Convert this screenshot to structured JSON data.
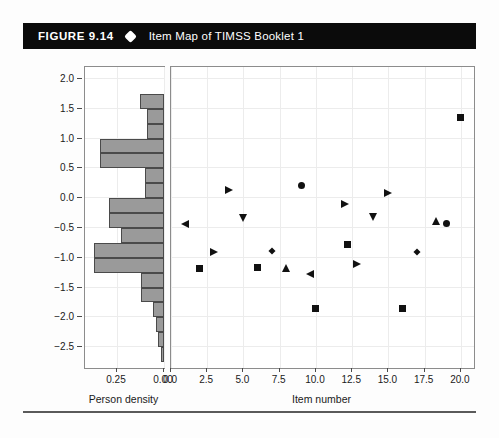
{
  "header": {
    "figure_label": "FIGURE 9.14",
    "bullet_icon": "diamond-bullet-icon",
    "title": "Item Map of TIMSS Booklet 1",
    "background_color": "#0b0b0b",
    "text_color": "#ffffff"
  },
  "chart_data": {
    "type": "scatter",
    "title": "Item Map of TIMSS Booklet 1",
    "ylabel": "Logits",
    "ylim": [
      -2.85,
      2.2
    ],
    "yticks": [
      2.0,
      1.5,
      1.0,
      0.5,
      0.0,
      -0.5,
      -1.0,
      -1.5,
      -2.0,
      -2.5
    ],
    "ytick_labels": [
      "2.0",
      "1.5",
      "1.0",
      "0.5",
      "0.0",
      "−0.5",
      "−1.0",
      "−1.5",
      "−2.0",
      "−2.5"
    ],
    "grid": true,
    "legend": "none",
    "marker_color": "#111111",
    "panels": [
      {
        "name": "person-density",
        "type": "bar",
        "orientation": "horizontal",
        "xlabel": "Person density",
        "xlim": [
          0.42,
          0.0
        ],
        "xticks": [
          0.25,
          0.0
        ],
        "xtick_labels": [
          "0.25",
          "0.00"
        ],
        "bar_fill": "#9a9a9a",
        "bar_edge": "#4a4a4a",
        "bin_edges": [
          2.0,
          1.75,
          1.5,
          1.25,
          1.0,
          0.75,
          0.5,
          0.25,
          0.0,
          -0.25,
          -0.5,
          -0.75,
          -1.0,
          -1.25,
          -1.5,
          -1.75,
          -2.0,
          -2.25,
          -2.5,
          -2.75
        ],
        "bin_centers": [
          1.875,
          1.625,
          1.375,
          1.125,
          0.875,
          0.625,
          0.375,
          0.125,
          -0.125,
          -0.375,
          -0.625,
          -0.875,
          -1.125,
          -1.375,
          -1.625,
          -1.875,
          -2.125,
          -2.375,
          -2.625
        ],
        "densities": [
          0.0,
          0.13,
          0.09,
          0.09,
          0.34,
          0.34,
          0.1,
          0.1,
          0.29,
          0.29,
          0.23,
          0.37,
          0.37,
          0.12,
          0.12,
          0.06,
          0.04,
          0.03,
          0.015
        ]
      },
      {
        "name": "item-map",
        "type": "scatter",
        "xlabel": "Item number",
        "xlim": [
          0.0,
          20.9
        ],
        "xticks": [
          0.0,
          2.5,
          5.0,
          7.5,
          10.0,
          12.5,
          15.0,
          17.5,
          20.0
        ],
        "xtick_labels": [
          "0.0",
          "2.5",
          "5.0",
          "7.5",
          "10.0",
          "12.5",
          "15.0",
          "17.5",
          "20.0"
        ],
        "points": [
          {
            "item": 1.0,
            "logit": -0.45,
            "shape": "triangle-left"
          },
          {
            "item": 2.0,
            "logit": -1.18,
            "shape": "square"
          },
          {
            "item": 3.0,
            "logit": -0.92,
            "shape": "triangle-right"
          },
          {
            "item": 4.0,
            "logit": 0.13,
            "shape": "triangle-right"
          },
          {
            "item": 5.0,
            "logit": -0.33,
            "shape": "triangle-down"
          },
          {
            "item": 6.0,
            "logit": -1.17,
            "shape": "square"
          },
          {
            "item": 7.0,
            "logit": -0.88,
            "shape": "diamond"
          },
          {
            "item": 8.0,
            "logit": -1.17,
            "shape": "triangle-up"
          },
          {
            "item": 9.0,
            "logit": 0.22,
            "shape": "circle"
          },
          {
            "item": 9.6,
            "logit": -1.28,
            "shape": "triangle-left"
          },
          {
            "item": 10.0,
            "logit": -1.85,
            "shape": "square"
          },
          {
            "item": 12.0,
            "logit": -0.1,
            "shape": "triangle-right"
          },
          {
            "item": 12.2,
            "logit": -0.78,
            "shape": "square"
          },
          {
            "item": 12.8,
            "logit": -1.12,
            "shape": "triangle-right"
          },
          {
            "item": 14.0,
            "logit": -0.32,
            "shape": "triangle-down"
          },
          {
            "item": 15.0,
            "logit": 0.08,
            "shape": "triangle-right"
          },
          {
            "item": 16.0,
            "logit": -1.85,
            "shape": "square"
          },
          {
            "item": 17.0,
            "logit": -0.9,
            "shape": "diamond"
          },
          {
            "item": 18.3,
            "logit": -0.38,
            "shape": "triangle-up"
          },
          {
            "item": 19.0,
            "logit": -0.42,
            "shape": "circle"
          },
          {
            "item": 20.0,
            "logit": 1.35,
            "shape": "square"
          }
        ]
      }
    ]
  }
}
